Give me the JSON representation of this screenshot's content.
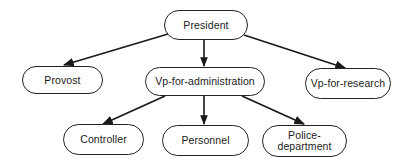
{
  "diagram": {
    "type": "org-chart",
    "nodes": {
      "president": {
        "label": "President"
      },
      "provost": {
        "label": "Provost"
      },
      "vp_admin": {
        "label": "Vp-for-administration"
      },
      "vp_research": {
        "label": "Vp-for-research"
      },
      "controller": {
        "label": "Controller"
      },
      "personnel": {
        "label": "Personnel"
      },
      "police_line1": {
        "label": "Police-"
      },
      "police_line2": {
        "label": "department"
      }
    },
    "edges": [
      {
        "from": "President",
        "to": "Provost"
      },
      {
        "from": "President",
        "to": "Vp-for-administration"
      },
      {
        "from": "President",
        "to": "Vp-for-research"
      },
      {
        "from": "Vp-for-administration",
        "to": "Controller"
      },
      {
        "from": "Vp-for-administration",
        "to": "Personnel"
      },
      {
        "from": "Vp-for-administration",
        "to": "Police-department"
      }
    ],
    "colors": {
      "line": "#1a1a1a",
      "background": "#ffffff"
    }
  }
}
